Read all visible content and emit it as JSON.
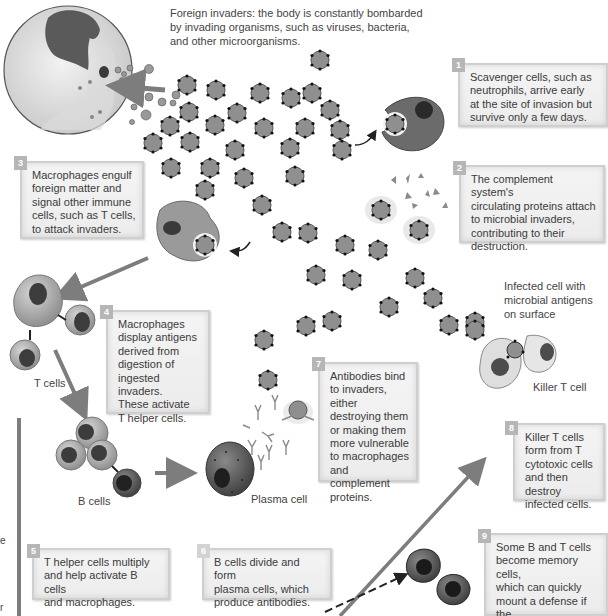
{
  "captions": {
    "foreign_invaders": "Foreign invaders: the body is constantly bombarded by invading organisms, such as viruses, bacteria, and other microorganisms.",
    "foreign_invaders_lines": [
      "Foreign invaders: the body is constantly bombarded",
      "by invading organisms, such as viruses, bacteria,",
      "and other microorganisms."
    ],
    "t_cells": "T cells",
    "b_cells": "B cells",
    "plasma_cell": "Plasma cell",
    "infected_cell_lines": [
      "Infected cell with",
      "microbial antigens",
      "on surface"
    ],
    "killer_t_cell": "Killer T cell"
  },
  "steps": [
    {
      "number": "1",
      "lines": [
        "Scavenger cells, such as",
        "neutrophils, arrive early",
        "at the site of invasion but",
        "survive only a few days."
      ]
    },
    {
      "number": "2",
      "lines": [
        "The complement system's",
        "circulating proteins attach",
        "to microbial invaders,",
        "contributing to their",
        "destruction."
      ]
    },
    {
      "number": "3",
      "lines": [
        "Macrophages engulf",
        "foreign matter and",
        "signal other immune",
        "cells, such as T cells,",
        "to attack invaders."
      ]
    },
    {
      "number": "4",
      "lines": [
        "Macrophages",
        "display antigens",
        "derived from",
        "digestion of",
        "ingested invaders.",
        "These activate",
        "T helper cells."
      ]
    },
    {
      "number": "5",
      "lines": [
        "T helper cells multiply",
        "and help activate B cells",
        "and macrophages."
      ]
    },
    {
      "number": "6",
      "lines": [
        "B cells divide and form",
        "plasma cells, which",
        "produce antibodies."
      ]
    },
    {
      "number": "7",
      "lines": [
        "Antibodies bind",
        "to invaders, either",
        "destroying them",
        "or making them",
        "more vulnerable",
        "to macrophages",
        "and complement",
        "proteins."
      ]
    },
    {
      "number": "8",
      "lines": [
        "Killer T cells",
        "form from T",
        "cytotoxic cells",
        "and then destroy",
        "infected cells."
      ]
    },
    {
      "number": "9",
      "lines": [
        "Some B and T cells",
        "become memory cells,",
        "which can quickly",
        "mount a defense if the",
        "same foreign invader",
        "attacks again."
      ]
    }
  ],
  "edge_fragments": [
    "e",
    "r"
  ],
  "colors": {
    "invader_fill": "#8f8f8f",
    "cell_fill": "#b5b5b5",
    "nucleus": "#4a4a4a",
    "arrow": "#7d7d7d",
    "badge": "#b6b6b6",
    "box_border": "#cfcfcf"
  }
}
